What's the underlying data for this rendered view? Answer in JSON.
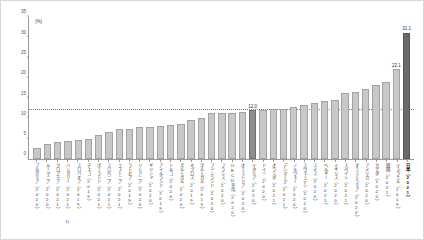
{
  "chart_data": {
    "type": "bar",
    "title": "",
    "unit_label": "(%)",
    "xlabel": "",
    "ylabel": "",
    "ylim": [
      0,
      35
    ],
    "yticks": [
      0,
      5,
      10,
      15,
      20,
      25,
      30,
      35
    ],
    "grid": false,
    "legend": null,
    "reference_line": {
      "value": 12.0,
      "label": "12.0",
      "style": "dotted"
    },
    "footnote_marker": "1)",
    "categories": [
      "ブルガリア（2020）",
      "ルーマニア（2020）",
      "クロアチア（2021）",
      "ハンガリー（2021）",
      "スロバキア（2019）",
      "チェコ（2019）",
      "ポーランド（2021）",
      "スロベニア（2021）",
      "エストニア（2021）",
      "ラトビア（2019）",
      "リトアニア（2020）",
      "ギリシャ（2020）",
      "アイルランド（2019）",
      "トルコ（2020）",
      "ポルトガル（2020）",
      "キプロス（2019）",
      "ポルトガル（2019）",
      "フィンランド（2020）",
      "フランス（2020）",
      "OECD平均（2020）",
      "オーストリア（2020）",
      "イタリア（2020）",
      "ドイツ（2020）",
      "オランダ（2021）",
      "デンマーク（2021）",
      "ノルウェー（2020）",
      "スウェーデン（2020）",
      "スイス（2020）",
      "ベルギー（2021）",
      "イギリス（2020）",
      "スペイン（2021）",
      "オーストラリア（2020）",
      "アメリカ（2020）",
      "カナダ（2020）",
      "韓国（2021）",
      "イスラエル（2019）",
      "日本（2021）"
    ],
    "values": [
      2.7,
      3.8,
      4.1,
      4.5,
      4.7,
      4.9,
      5.8,
      6.6,
      7.3,
      7.4,
      7.9,
      8.0,
      8.2,
      8.5,
      8.7,
      9.5,
      10.0,
      11.3,
      11.4,
      11.4,
      11.5,
      12.0,
      12.2,
      12.3,
      12.4,
      12.7,
      13.4,
      13.8,
      14.2,
      14.5,
      16.2,
      16.4,
      17.3,
      18.3,
      19.1,
      22.1,
      31.1
    ],
    "highlight_index": 21,
    "highlight_last_index": 36,
    "data_labels": [
      {
        "index": 21,
        "text": "12.0"
      },
      {
        "index": 35,
        "text": "22.1"
      },
      {
        "index": 36,
        "text": "31.1"
      }
    ],
    "footnote_index": 3
  }
}
